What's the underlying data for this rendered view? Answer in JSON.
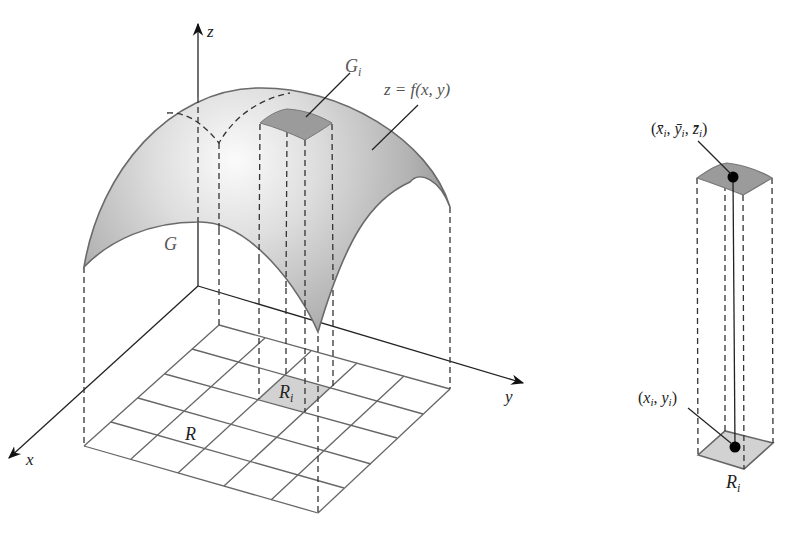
{
  "figure": {
    "left": {
      "axes": {
        "z_label": "z",
        "y_label": "y",
        "x_label": "x"
      },
      "surface": {
        "label": "G",
        "equation_label": "z = f(x, y)"
      },
      "patch": {
        "label_main": "G",
        "label_sub": "i"
      },
      "region": {
        "label": "R"
      },
      "subregion": {
        "label_main": "R",
        "label_sub": "i"
      }
    },
    "right": {
      "top_point_label": "(x̄ᵢ, ȳᵢ, z̄ᵢ)",
      "top_point": {
        "open": "(",
        "x": "x̄",
        "y": "ȳ",
        "z": "z̄",
        "sub": "i",
        "close": ")"
      },
      "bottom_point": {
        "open": "(",
        "x": "x",
        "y": "y",
        "sub": "i",
        "close": ")"
      },
      "subregion": {
        "label_main": "R",
        "label_sub": "i"
      }
    },
    "colors": {
      "surface_light": "#f4f4f4",
      "surface_dark": "#9a9a9a",
      "patch_fill": "#9b9b9b",
      "subregion_fill": "#d2d2d2",
      "line": "#333333"
    }
  }
}
